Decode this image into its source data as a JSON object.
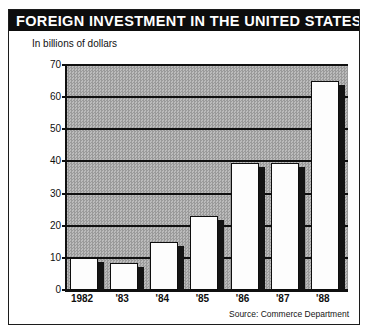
{
  "figure": {
    "title": "FOREIGN INVESTMENT IN THE UNITED STATES",
    "subtitle": "In billions of dollars",
    "source": "Source: Commerce Department",
    "colors": {
      "title_bar": "#0d0d0d",
      "title_text": "#ffffff",
      "plot_background": "#a8a8a8",
      "bar_face": "#fdfdfd",
      "bar_outline": "#0e0e0e",
      "bar_shadow": "#141414",
      "gridline": "#101010"
    }
  },
  "chart_data": {
    "type": "bar",
    "title": "FOREIGN INVESTMENT IN THE UNITED STATES",
    "subtitle": "In billions of dollars",
    "xlabel": "",
    "ylabel": "In billions of dollars",
    "ylim": [
      0,
      70
    ],
    "ytick_step": 10,
    "yticks": [
      0,
      10,
      20,
      30,
      40,
      50,
      60,
      70
    ],
    "ytick_labels": [
      "0",
      "10",
      "20",
      "30",
      "40",
      "50",
      "60",
      "70"
    ],
    "grid": true,
    "grid_axis": "y",
    "legend": false,
    "categories": [
      "1982",
      "'83",
      "'84",
      "'85",
      "'86",
      "'87",
      "'88"
    ],
    "values": [
      10,
      8.5,
      15,
      23,
      39.5,
      39.5,
      65
    ],
    "series": [
      {
        "name": "Foreign investment",
        "values": [
          10,
          8.5,
          15,
          23,
          39.5,
          39.5,
          65
        ]
      }
    ],
    "annotations": [
      "Source: Commerce Department"
    ],
    "units": "billions of dollars",
    "style": "3d-shadowed white bars on halftone gray plot field"
  }
}
